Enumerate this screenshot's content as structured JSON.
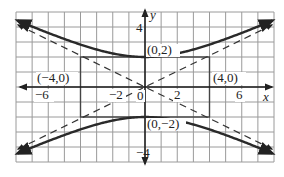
{
  "chart_data": {
    "type": "line",
    "title": "",
    "xlabel": "x",
    "ylabel": "y",
    "xlim": [
      -8,
      8
    ],
    "ylim": [
      -5,
      5
    ],
    "grid": true,
    "x_tick_labels": [
      "-6",
      "-2",
      "0",
      "2",
      "6"
    ],
    "x_ticks": [
      -6,
      -2,
      0,
      2,
      6
    ],
    "y_tick_labels": [
      "4",
      "-4"
    ],
    "y_ticks": [
      4,
      -4
    ],
    "series": [
      {
        "name": "upper branch",
        "style": "solid",
        "equation": "y = 2*sqrt(1 + x^2/16)",
        "x": [
          -8,
          -6,
          -4,
          -2,
          0,
          2,
          4,
          6,
          8
        ],
        "y": [
          4.47,
          3.61,
          2.83,
          2.24,
          2,
          2.24,
          2.83,
          3.61,
          4.47
        ]
      },
      {
        "name": "lower branch",
        "style": "solid",
        "equation": "y = -2*sqrt(1 + x^2/16)",
        "x": [
          -8,
          -6,
          -4,
          -2,
          0,
          2,
          4,
          6,
          8
        ],
        "y": [
          -4.47,
          -3.61,
          -2.83,
          -2.24,
          -2,
          -2.24,
          -2.83,
          -3.61,
          -4.47
        ]
      },
      {
        "name": "asymptote y = x/2",
        "style": "dashed",
        "x": [
          -8,
          8
        ],
        "y": [
          -4,
          4
        ]
      },
      {
        "name": "asymptote y = -x/2",
        "style": "dashed",
        "x": [
          -8,
          8
        ],
        "y": [
          4,
          -4
        ]
      }
    ],
    "rectangle": {
      "x": [
        -4,
        4
      ],
      "y": [
        -2,
        2
      ]
    },
    "annotations": [
      {
        "text": "(0,2)",
        "x": 0,
        "y": 2
      },
      {
        "text": "(0,−2)",
        "x": 0,
        "y": -2
      },
      {
        "text": "(−4,0)",
        "x": -4,
        "y": 0
      },
      {
        "text": "(4,0)",
        "x": 4,
        "y": 0
      }
    ]
  },
  "labels": {
    "x_axis": "x",
    "y_axis": "y",
    "tick_m6": "−6",
    "tick_m2": "−2",
    "tick_0": "0",
    "tick_2": "2",
    "tick_6": "6",
    "tick_y4": "4",
    "tick_ym4": "−4",
    "pt_top": "(0,2)",
    "pt_bottom": "(0,−2)",
    "pt_left": "(−4,0)",
    "pt_right": "(4,0)"
  },
  "colors": {
    "grid": "#9a9a9a",
    "axis": "#1a1a1a",
    "curve": "#2a2a2a",
    "asymptote": "#333333"
  }
}
